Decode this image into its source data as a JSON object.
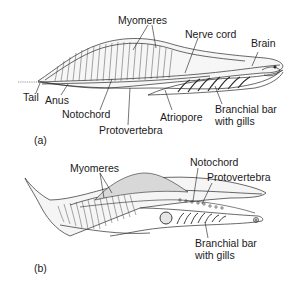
{
  "figure": {
    "panel_a": {
      "tag": "(a)",
      "labels": {
        "myomeres": "Myomeres",
        "nerve_cord": "Nerve cord",
        "brain": "Brain",
        "tail": "Tail",
        "anus": "Anus",
        "notochord": "Notochord",
        "protovertebra": "Protovertebra",
        "atriopore": "Atriopore",
        "branchial_bar_line1": "Branchial bar",
        "branchial_bar_line2": "with gills"
      }
    },
    "panel_b": {
      "tag": "(b)",
      "labels": {
        "myomeres": "Myomeres",
        "notochord": "Notochord",
        "protovertebra": "Protovertebra",
        "branchial_bar_line1": "Branchial bar",
        "branchial_bar_line2": "with gills"
      }
    },
    "colors": {
      "ink": "#1a1a1a",
      "body_fill": "#f4f4f4",
      "shade": "#cfcfcf"
    }
  }
}
